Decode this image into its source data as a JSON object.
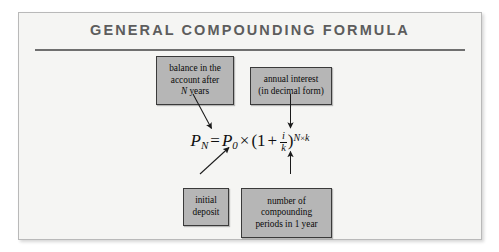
{
  "figure": {
    "title": "GENERAL COMPOUNDING FORMULA",
    "accent_color": "#6f6f6f",
    "box_fill_color": "#b6b6b6",
    "box_border_color": "#3a3a3a",
    "background_color": "#f5f5f3"
  },
  "formula": {
    "full_text": "P_N = P_0 × (1 + i/k)^(N×k)",
    "lhs_var": "P",
    "lhs_sub": "N",
    "equals": "=",
    "p0_var": "P",
    "p0_sub": "0",
    "times": "×",
    "open_paren": "(",
    "one": "1",
    "plus": "+",
    "frac_num": "i",
    "frac_den": "k",
    "close_paren": ")",
    "exp_n": "N",
    "exp_times": "×",
    "exp_k": "k"
  },
  "callouts": [
    {
      "id": "balance",
      "lines": [
        "balance in the",
        "account after",
        "N years"
      ],
      "italic_lead": "N",
      "tail": " years",
      "points_to": "P_N"
    },
    {
      "id": "rate",
      "lines": [
        "annual interest",
        "(in decimal form)"
      ],
      "points_to": "i"
    },
    {
      "id": "deposit",
      "lines": [
        "initial",
        "deposit"
      ],
      "points_to": "P_0"
    },
    {
      "id": "periods",
      "lines": [
        "number of",
        "compounding",
        "periods in 1 year"
      ],
      "points_to": "k"
    }
  ]
}
